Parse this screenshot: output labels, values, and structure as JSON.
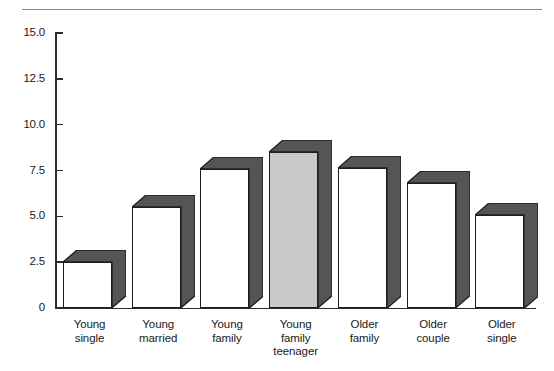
{
  "chart_data": {
    "type": "bar",
    "title": "",
    "subtitle": "",
    "xlabel": "",
    "ylabel": "",
    "ylim": [
      0,
      15.0
    ],
    "grid": false,
    "legend": false,
    "legend_position": "none",
    "style": "3d-shadow-bars",
    "categories": [
      "Young\nsingle",
      "Young\nmarried",
      "Young\nfamily",
      "Young\nfamily\nteenager",
      "Older\nfamily",
      "Older\ncouple",
      "Older\nsingle"
    ],
    "category_lines": [
      [
        "Young",
        "single"
      ],
      [
        "Young",
        "married"
      ],
      [
        "Young",
        "family"
      ],
      [
        "Young",
        "family",
        "teenager"
      ],
      [
        "Older",
        "family"
      ],
      [
        "Older",
        "couple"
      ],
      [
        "Older",
        "single"
      ]
    ],
    "values": [
      2.5,
      5.5,
      7.6,
      8.5,
      7.65,
      6.8,
      5.1
    ],
    "highlighted_index": 3,
    "ytick_labels": [
      "15.0",
      "12.5",
      "10.0",
      "7.5",
      "5.0",
      "2.5",
      "0"
    ],
    "ytick_values": [
      15.0,
      12.5,
      10.0,
      7.5,
      5.0,
      2.5,
      0
    ],
    "colors": {
      "bar_fill": "#ffffff",
      "bar_fill_highlight": "#c9c9c9",
      "bar_outline": "#1e1e1e",
      "bar_side_shadow": "#555555",
      "axis": "#2b2b2b",
      "rule": "#8a8a8a",
      "text": "#1a1a1a"
    }
  }
}
